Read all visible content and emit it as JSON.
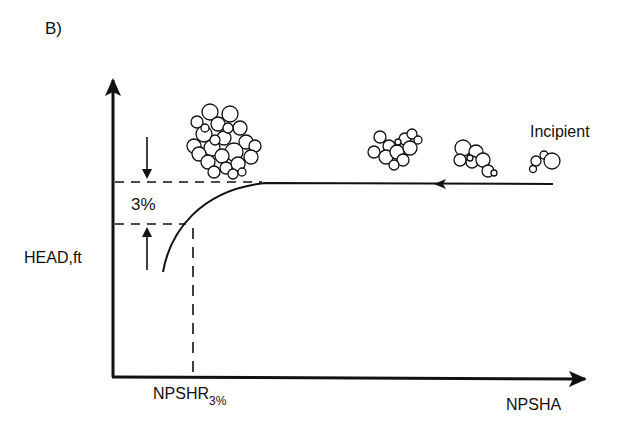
{
  "figure": {
    "panel_label": "B)",
    "y_axis_label": "HEAD,ft",
    "x_axis_label": "NPSHA",
    "x_marker_label": "NPSHR",
    "x_marker_subscript": "3%",
    "drop_label": "3%",
    "annotation": "Incipient",
    "colors": {
      "ink": "#111111",
      "background": "#ffffff"
    }
  }
}
